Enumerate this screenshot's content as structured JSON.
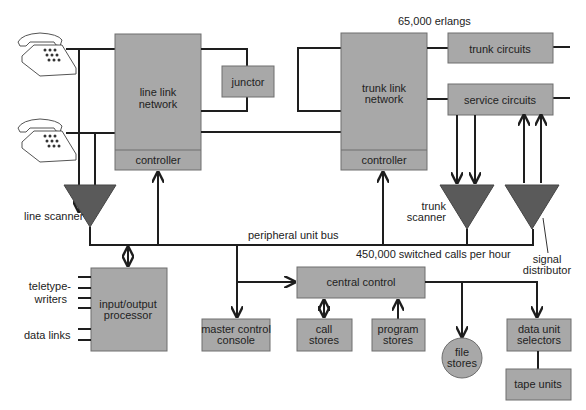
{
  "diagram": {
    "annotations": {
      "erlangs": "65,000 erlangs",
      "calls_per_hour": "450,000 switched calls per hour",
      "bus": "peripheral unit bus"
    },
    "blocks": {
      "line_link_network": {
        "line1": "line link",
        "line2": "network",
        "controller": "controller"
      },
      "junctor": "junctor",
      "trunk_link_network": {
        "line1": "trunk link",
        "line2": "network",
        "controller": "controller"
      },
      "trunk_circuits": "trunk circuits",
      "service_circuits": "service circuits",
      "io_processor": {
        "line1": "input/output",
        "line2": "processor"
      },
      "master_control_console": {
        "line1": "master control",
        "line2": "console"
      },
      "central_control": "central control",
      "call_stores": {
        "line1": "call",
        "line2": "stores"
      },
      "program_stores": {
        "line1": "program",
        "line2": "stores"
      },
      "file_stores": {
        "line1": "file",
        "line2": "stores"
      },
      "data_unit_selectors": {
        "line1": "data unit",
        "line2": "selectors"
      },
      "tape_units": "tape units"
    },
    "side_labels": {
      "line_scanner": "line scanner",
      "trunk_scanner": {
        "line1": "trunk",
        "line2": "scanner"
      },
      "signal_distributor": {
        "line1": "signal",
        "line2": "distributor"
      },
      "teletypewriters": {
        "line1": "teletype-",
        "line2": "writers"
      },
      "data_links": "data links"
    },
    "colors": {
      "block_fill": "#a8a8a8",
      "triangle_fill": "#5a5a5a",
      "line": "#1e1e1e"
    }
  }
}
